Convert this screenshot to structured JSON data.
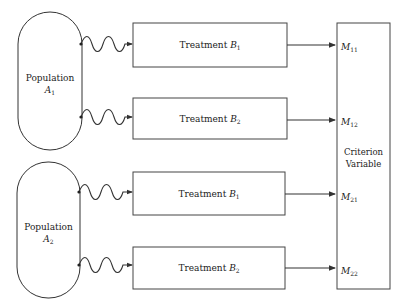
{
  "populations": [
    {
      "label": "Population",
      "symbol": "A",
      "subscript": "1"
    },
    {
      "label": "Population",
      "symbol": "A",
      "subscript": "2"
    }
  ],
  "treatments": [
    {
      "label": "Treatment",
      "symbol": "B",
      "subscript": "1"
    },
    {
      "label": "Treatment",
      "symbol": "B",
      "subscript": "2"
    },
    {
      "label": "Treatment",
      "symbol": "B",
      "subscript": "1"
    },
    {
      "label": "Treatment",
      "symbol": "B",
      "subscript": "2"
    }
  ],
  "measures": [
    {
      "symbol": "M",
      "subscript": "11"
    },
    {
      "symbol": "M",
      "subscript": "12"
    },
    {
      "symbol": "M",
      "subscript": "21"
    },
    {
      "symbol": "M",
      "subscript": "22"
    }
  ],
  "criterion": {
    "line1": "Criterion",
    "line2": "Variable"
  },
  "colors": {
    "stroke": "#333333",
    "background": "#ffffff"
  }
}
